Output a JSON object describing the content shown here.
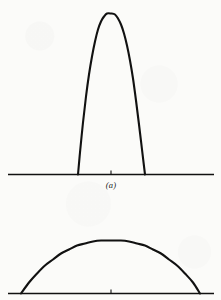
{
  "figure": {
    "background_color": "#fbfbf9",
    "ink_color": "#111111",
    "width": 221,
    "height": 300,
    "panel_a_caption": "(a)"
  },
  "chart_data": [
    {
      "type": "line",
      "panel": "(a)",
      "title": "",
      "subtitle": "",
      "xlabel": "",
      "ylabel": "",
      "description": "Narrow, tall bell-shaped pulse rising steeply from a horizontal baseline axis to a rounded apex; steep near-vertical flanks.",
      "grid": false,
      "legend": null,
      "axis": {
        "baseline_y": 0,
        "baseline_x_start": 8,
        "baseline_x_end": 214,
        "center_tick_x": 111,
        "tick_length": 4,
        "axis_visible": true
      },
      "xlim": [
        8,
        214
      ],
      "ylim": [
        0,
        162
      ],
      "peak": {
        "x": 111,
        "y": 161
      },
      "half_width_at_base": 33.5,
      "series": [
        {
          "name": "narrow-pulse",
          "x": [
            78,
            80,
            83,
            86,
            89,
            92,
            95,
            98,
            101,
            104,
            107,
            111,
            115,
            118,
            121,
            124,
            127,
            130,
            133,
            136,
            139,
            142,
            145
          ],
          "y": [
            0,
            22,
            52,
            78,
            100,
            118,
            133,
            145,
            153,
            158,
            161,
            161,
            160,
            156,
            150,
            141,
            129,
            114,
            96,
            74,
            50,
            25,
            0
          ]
        }
      ]
    },
    {
      "type": "line",
      "panel": "",
      "title": "",
      "subtitle": "",
      "xlabel": "",
      "ylabel": "",
      "description": "Broad, low dome-shaped pulse spanning most of the baseline with a shallow rounded apex; shallow sloping flanks.",
      "grid": false,
      "legend": null,
      "axis": {
        "baseline_y": 0,
        "baseline_x_start": 8,
        "baseline_x_end": 214,
        "center_tick_x": 111,
        "tick_length": 4,
        "axis_visible": true
      },
      "xlim": [
        8,
        214
      ],
      "ylim": [
        0,
        56
      ],
      "peak": {
        "x": 111,
        "y": 53
      },
      "half_width_at_base": 89.5,
      "series": [
        {
          "name": "broad-dome",
          "x": [
            21,
            29,
            37,
            45,
            53,
            61,
            69,
            77,
            85,
            93,
            101,
            111,
            121,
            129,
            137,
            145,
            153,
            161,
            169,
            177,
            185,
            193,
            200
          ],
          "y": [
            0,
            11,
            20,
            28,
            34,
            40,
            44,
            48,
            50,
            52,
            53,
            53,
            53,
            52,
            50,
            48,
            44,
            40,
            34,
            28,
            20,
            11,
            0
          ]
        }
      ]
    }
  ]
}
